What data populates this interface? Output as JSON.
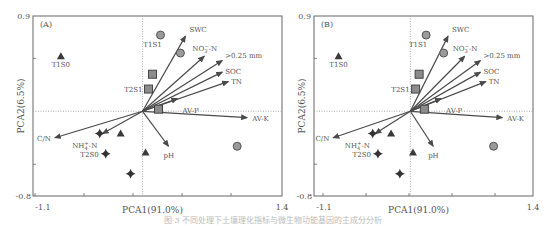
{
  "chart_data": [
    {
      "type": "scatter",
      "subtype": "pca-biplot",
      "panel_label": "(A)",
      "xlabel": "PCA1(91.0%)",
      "ylabel": "PCA2(6.5%)",
      "xlim": [
        -1.1,
        1.4
      ],
      "ylim": [
        -0.8,
        0.9
      ],
      "x_tick_labels": [
        "-1.1",
        "1.4"
      ],
      "y_tick_labels": [
        "0.9",
        "-0.8"
      ],
      "grid": false,
      "reference_lines": {
        "x": 0,
        "y": 0,
        "style": "dotted"
      },
      "vectors": [
        {
          "label": "SWC",
          "x": 0.43,
          "y": 0.71
        },
        {
          "label": "NO3−-N",
          "x": 0.62,
          "y": 0.52
        },
        {
          "label": ">0.25 mm",
          "x": 0.8,
          "y": 0.48
        },
        {
          "label": "SOC",
          "x": 0.8,
          "y": 0.37
        },
        {
          "label": "TN",
          "x": 0.86,
          "y": 0.28
        },
        {
          "label": "AV-P",
          "x": 0.35,
          "y": 0.12
        },
        {
          "label": "AV-K",
          "x": 1.05,
          "y": -0.06
        },
        {
          "label": "pH",
          "x": 0.26,
          "y": -0.33
        },
        {
          "label": "NH4+-N",
          "x": -0.4,
          "y": -0.21
        },
        {
          "label": "C/N",
          "x": -0.88,
          "y": -0.25
        }
      ],
      "points": [
        {
          "marker": "triangle",
          "label": "T1S0",
          "x": -0.82,
          "y": 0.52
        },
        {
          "marker": "triangle",
          "label": "",
          "x": -0.22,
          "y": -0.21
        },
        {
          "marker": "triangle",
          "label": "",
          "x": 0.03,
          "y": -0.39
        },
        {
          "marker": "circle",
          "label": "T1S1",
          "x": 0.18,
          "y": 0.72
        },
        {
          "marker": "circle",
          "label": "",
          "x": 0.38,
          "y": 0.55
        },
        {
          "marker": "circle",
          "label": "",
          "x": 0.95,
          "y": -0.33
        },
        {
          "marker": "square",
          "label": "",
          "x": 0.1,
          "y": 0.35
        },
        {
          "marker": "square",
          "label": "T2S1",
          "x": 0.06,
          "y": 0.21
        },
        {
          "marker": "square",
          "label": "",
          "x": 0.16,
          "y": 0.02
        },
        {
          "marker": "diamond",
          "label": "",
          "x": -0.43,
          "y": -0.21
        },
        {
          "marker": "diamond",
          "label": "T2S0",
          "x": -0.37,
          "y": -0.4
        },
        {
          "marker": "diamond",
          "label": "",
          "x": -0.12,
          "y": -0.59
        }
      ]
    },
    {
      "type": "scatter",
      "subtype": "pca-biplot",
      "panel_label": "(B)",
      "xlabel": "PCA1(91.0%)",
      "ylabel": "PCA2(6.5%)",
      "xlim": [
        -1.1,
        1.4
      ],
      "ylim": [
        -0.8,
        0.9
      ],
      "x_tick_labels": [
        "-1.1",
        "1.4"
      ],
      "y_tick_labels": [
        "0.9",
        "-0.8"
      ],
      "grid": false,
      "reference_lines": {
        "x": 0,
        "y": 0,
        "style": "dotted"
      },
      "vectors": [
        {
          "label": "SWC",
          "x": 0.43,
          "y": 0.71
        },
        {
          "label": "NO3−-N",
          "x": 0.62,
          "y": 0.52
        },
        {
          "label": ">0.25 mm",
          "x": 0.8,
          "y": 0.48
        },
        {
          "label": "SOC",
          "x": 0.8,
          "y": 0.37
        },
        {
          "label": "TN",
          "x": 0.86,
          "y": 0.28
        },
        {
          "label": "AV-P",
          "x": 0.35,
          "y": 0.12
        },
        {
          "label": "AV-K",
          "x": 1.05,
          "y": -0.06
        },
        {
          "label": "pH",
          "x": 0.26,
          "y": -0.33
        },
        {
          "label": "NH4+-N",
          "x": -0.4,
          "y": -0.21
        },
        {
          "label": "C/N",
          "x": -0.88,
          "y": -0.25
        }
      ],
      "points": [
        {
          "marker": "triangle",
          "label": "T1S0",
          "x": -0.82,
          "y": 0.52
        },
        {
          "marker": "triangle",
          "label": "",
          "x": -0.22,
          "y": -0.21
        },
        {
          "marker": "triangle",
          "label": "",
          "x": 0.03,
          "y": -0.39
        },
        {
          "marker": "circle",
          "label": "T1S1",
          "x": 0.18,
          "y": 0.72
        },
        {
          "marker": "circle",
          "label": "",
          "x": 0.38,
          "y": 0.55
        },
        {
          "marker": "circle",
          "label": "",
          "x": 0.95,
          "y": -0.33
        },
        {
          "marker": "square",
          "label": "",
          "x": 0.1,
          "y": 0.35
        },
        {
          "marker": "square",
          "label": "T2S1",
          "x": 0.06,
          "y": 0.21
        },
        {
          "marker": "square",
          "label": "",
          "x": 0.16,
          "y": 0.02
        },
        {
          "marker": "diamond",
          "label": "",
          "x": -0.43,
          "y": -0.21
        },
        {
          "marker": "diamond",
          "label": "T2S0",
          "x": -0.37,
          "y": -0.4
        },
        {
          "marker": "diamond",
          "label": "",
          "x": -0.12,
          "y": -0.59
        }
      ]
    }
  ],
  "colors": {
    "axis": "#666666",
    "vector": "#4a4a4a",
    "triangle": "#3a3a3a",
    "circle_fill": "#9a9a9a",
    "square_fill": "#8c8c8c",
    "diamond": "#333333",
    "refline": "#999999"
  },
  "caption": "图 3  不同处理下土壤理化指标与微生物功能基因的主成分分析"
}
